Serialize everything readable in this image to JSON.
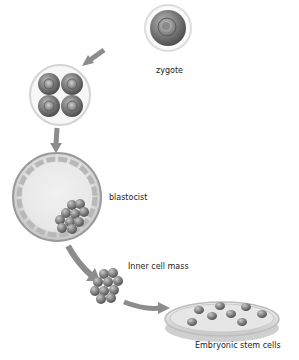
{
  "diagram": {
    "stages": [
      {
        "id": "zygote",
        "label": "zygote"
      },
      {
        "id": "four-cell",
        "label": ""
      },
      {
        "id": "blastocyst",
        "label": "blastocist"
      },
      {
        "id": "inner-cell-mass",
        "label": "Inner cell mass"
      },
      {
        "id": "embryonic-stem-cells",
        "label": "Embryonic stem cells"
      }
    ],
    "colors": {
      "arrow": "#8c8c8c",
      "cell_dark": "#6a6a6a",
      "cell_light": "#c8c8c8",
      "membrane": "#d6d6d6",
      "blastocyst_fill": "#e4e4e4",
      "dish": "#dcdcdc"
    }
  }
}
